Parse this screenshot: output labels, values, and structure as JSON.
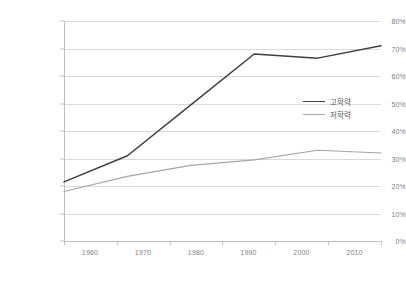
{
  "chart_data": {
    "type": "line",
    "title": "",
    "subtitle": "",
    "xlabel": "",
    "ylabel": "",
    "categories": [
      "1960",
      "1970",
      "1980",
      "1990",
      "2000",
      "2010"
    ],
    "x": [
      1960,
      1970,
      1980,
      1990,
      2000,
      2010
    ],
    "xlim": [
      1960,
      2010
    ],
    "ylim": [
      0,
      80
    ],
    "ytick_labels": [
      "0%",
      "10%",
      "20%",
      "30%",
      "40%",
      "50%",
      "60%",
      "70%",
      "80%"
    ],
    "ytick_values": [
      0,
      10,
      20,
      30,
      40,
      50,
      60,
      70,
      80
    ],
    "grid": true,
    "legend_position": "center-right",
    "series": [
      {
        "name": "고학력",
        "color": "#3f3f3f",
        "values": [
          21.5,
          31.0,
          49.5,
          68.0,
          66.5,
          71.0
        ]
      },
      {
        "name": "저학력",
        "color": "#a6a6a6",
        "values": [
          18.0,
          23.5,
          27.5,
          29.5,
          33.0,
          32.0
        ]
      }
    ]
  },
  "axis": {
    "grid_color": "#d9d9d9",
    "axis_color": "#bfbfbf",
    "tick_text_color": "#808080"
  }
}
